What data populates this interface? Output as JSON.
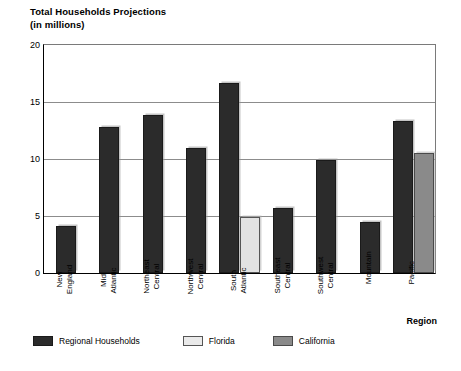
{
  "chart_data": {
    "type": "bar",
    "title": "Total Households Projections\n(in millions)",
    "title_line1": "Total Households Projections",
    "title_line2": "(in millions)",
    "xlabel": "Region",
    "ylabel": "",
    "ylim": [
      0,
      20
    ],
    "yticks": [
      0,
      5,
      10,
      15,
      20
    ],
    "ytick_labels": [
      "0",
      "5",
      "10",
      "15",
      "20"
    ],
    "grid": "horizontal",
    "legend_position": "below-axes-left",
    "categories": [
      "New\nEngland",
      "Mid\nAtlantic",
      "Northeast\nCentral",
      "Northwest\nCentral",
      "South\nAtlantic",
      "Southeast\nCentral",
      "Southwest\nCentral",
      "Mountain",
      "Pacific"
    ],
    "category_labels": [
      {
        "line1": "New",
        "line2": "England"
      },
      {
        "line1": "Mid",
        "line2": "Atlantic"
      },
      {
        "line1": "Northeast",
        "line2": "Central"
      },
      {
        "line1": "Northwest",
        "line2": "Central"
      },
      {
        "line1": "South",
        "line2": "Atlantic"
      },
      {
        "line1": "Southeast",
        "line2": "Central"
      },
      {
        "line1": "Southwest",
        "line2": "Central"
      },
      {
        "line1": "Mountain",
        "line2": ""
      },
      {
        "line1": "Pacific",
        "line2": ""
      }
    ],
    "series": [
      {
        "name": "Regional Households",
        "color": "#2b2b2b",
        "values": [
          4.1,
          12.8,
          13.9,
          11.0,
          16.7,
          5.7,
          9.9,
          4.5,
          13.3
        ]
      },
      {
        "name": "Florida",
        "color": "#eaeaea",
        "values": [
          null,
          null,
          null,
          null,
          4.9,
          null,
          null,
          null,
          null
        ]
      },
      {
        "name": "California",
        "color": "#8a8a8a",
        "values": [
          null,
          null,
          null,
          null,
          null,
          null,
          null,
          null,
          10.5
        ]
      }
    ]
  },
  "legend": {
    "items": [
      {
        "label": "Regional Households",
        "swatch": "regional"
      },
      {
        "label": "Florida",
        "swatch": "florida"
      },
      {
        "label": "California",
        "swatch": "california"
      }
    ]
  },
  "colors": {
    "regional": "#2b2b2b",
    "florida": "#eaeaea",
    "california": "#8a8a8a",
    "gridline": "#8c8c8c",
    "axis": "#000000",
    "background": "#ffffff"
  }
}
